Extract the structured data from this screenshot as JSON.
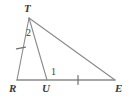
{
  "figure": {
    "type": "geometry-diagram",
    "shape": "triangle-with-cevian",
    "width": 129,
    "height": 100,
    "background_color": "#ffffff",
    "stroke_color": "#8a8a8a",
    "text_color": "#3a3a3a",
    "vertices": [
      {
        "id": "T",
        "label": "T",
        "x": 29,
        "y": 18
      },
      {
        "id": "R",
        "label": "R",
        "x": 17,
        "y": 80
      },
      {
        "id": "U",
        "label": "U",
        "x": 47,
        "y": 80
      },
      {
        "id": "E",
        "label": "E",
        "x": 115,
        "y": 80
      }
    ],
    "segments": [
      {
        "id": "TR",
        "from": "T",
        "to": "R"
      },
      {
        "id": "TU",
        "from": "T",
        "to": "U"
      },
      {
        "id": "TE",
        "from": "T",
        "to": "E"
      },
      {
        "id": "RE",
        "from": "R",
        "to": "E"
      }
    ],
    "tick_marks": [
      {
        "id": "tick-TR",
        "on_segment": "TR",
        "count": 1,
        "x": 21,
        "y": 48
      },
      {
        "id": "tick-UE",
        "on_segment": "UE",
        "count": 1,
        "x": 78,
        "y": 80
      }
    ],
    "angle_labels": [
      {
        "id": "angle-2",
        "label": "2",
        "at_vertex": "T",
        "x": 29,
        "y": 33
      },
      {
        "id": "angle-1",
        "label": "1",
        "at_vertex": "U",
        "x": 54,
        "y": 73
      }
    ],
    "vertex_labels": {
      "T": "T",
      "R": "R",
      "U": "U",
      "E": "E"
    }
  }
}
